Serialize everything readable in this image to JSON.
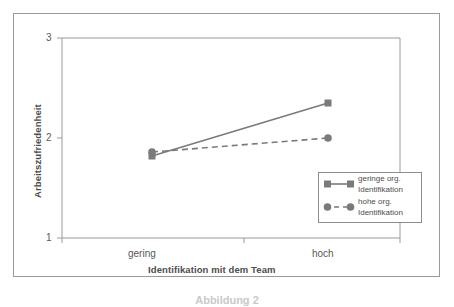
{
  "figure": {
    "caption": "Abbildung 2"
  },
  "chart_data": {
    "type": "line",
    "title": "",
    "xlabel": "Identifikation mit dem Team",
    "ylabel": "Arbeitszufriedenheit",
    "categories": [
      "gering",
      "hoch"
    ],
    "ytick_labels": [
      "1",
      "2",
      "3"
    ],
    "yticks": [
      1,
      2,
      3
    ],
    "ylim": [
      1,
      3
    ],
    "grid": false,
    "legend_position": "lower right",
    "series": [
      {
        "name": "geringe org. Identifikation",
        "name_line1": "geringe org.",
        "name_line2": "Identifikation",
        "values": [
          1.82,
          2.35
        ],
        "marker": "square",
        "linestyle": "solid",
        "color": "#7a7a7a"
      },
      {
        "name": "hohe org. Identifikation",
        "name_line1": "hohe org.",
        "name_line2": "Identifikation",
        "values": [
          1.86,
          2.0
        ],
        "marker": "circle",
        "linestyle": "dashed",
        "color": "#7a7a7a"
      }
    ]
  },
  "axes": {
    "y_tick_3": "3",
    "y_tick_2": "2",
    "y_tick_1": "1",
    "x_tick_left": "gering",
    "x_tick_right": "hoch"
  },
  "colors": {
    "line": "#7a7a7a",
    "axis": "#9a9a9a",
    "text": "#4d4d4d",
    "frame": "#9a9a9a"
  }
}
